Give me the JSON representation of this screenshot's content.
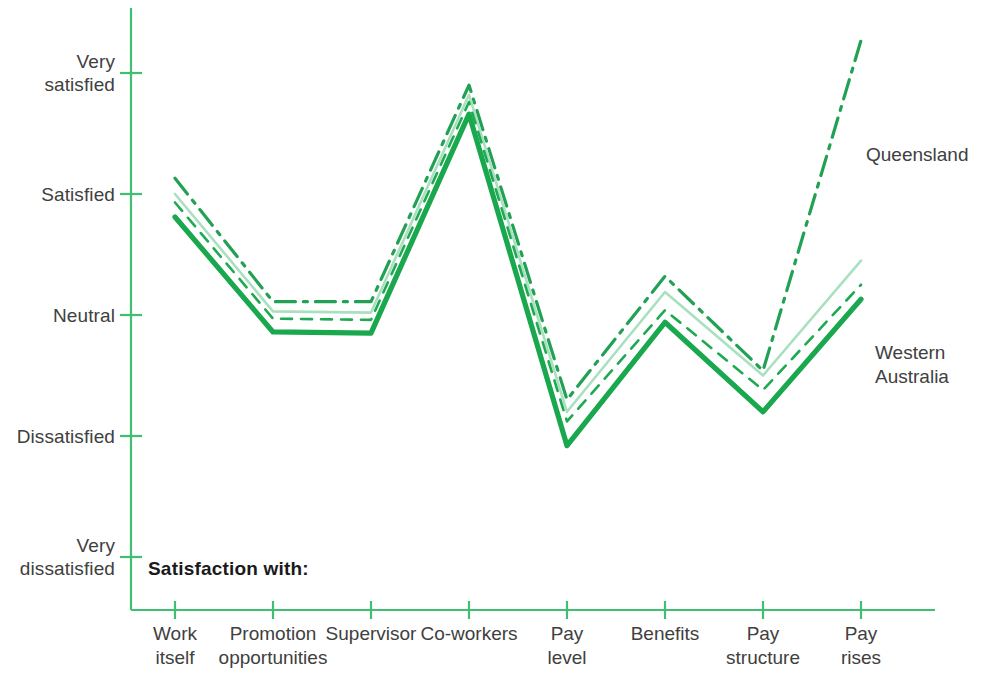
{
  "chart_data": {
    "type": "line",
    "title": "",
    "xlabel": "",
    "ylabel": "",
    "legend_title": "Satisfaction with:",
    "legend_position": "inline-right",
    "grid": false,
    "categories": [
      "Work\nitself",
      "Promotion\nopportunities",
      "Supervisor",
      "Co-workers",
      "Pay\nlevel",
      "Benefits",
      "Pay\nstructure",
      "Pay\nrises"
    ],
    "ytick_labels": [
      "Very\nsatisfied",
      "Satisfied",
      "Neutral",
      "Dissatisfied",
      "Very\ndissatisfied"
    ],
    "ytick_values": [
      5,
      4,
      3,
      2,
      1
    ],
    "ylim": [
      1,
      5
    ],
    "series": [
      {
        "name": "Queensland",
        "style": "dash-dot",
        "color": "#22a154",
        "width": 3.2,
        "labelled": true,
        "values": [
          4.13,
          3.11,
          3.11,
          4.9,
          2.3,
          3.32,
          2.54,
          5.27
        ]
      },
      {
        "name": "Series 2",
        "style": "solid-light",
        "color": "#a9e0bf",
        "width": 2.6,
        "labelled": false,
        "values": [
          4.0,
          3.03,
          3.02,
          4.82,
          2.2,
          3.19,
          2.5,
          3.45
        ]
      },
      {
        "name": "Series 3",
        "style": "dashed",
        "color": "#1faa52",
        "width": 2.6,
        "labelled": false,
        "values": [
          3.93,
          2.97,
          2.96,
          4.76,
          2.12,
          3.04,
          2.38,
          3.25
        ]
      },
      {
        "name": "Western\nAustralia",
        "style": "solid-thick",
        "color": "#19a84e",
        "width": 5.2,
        "labelled": true,
        "values": [
          3.81,
          2.86,
          2.85,
          4.66,
          1.92,
          2.94,
          2.2,
          3.13
        ]
      }
    ],
    "annotations": [
      {
        "text": "Queensland",
        "series": "Queensland"
      },
      {
        "text": "Western\nAustralia",
        "series": "Western\nAustralia"
      }
    ],
    "axis_color": "#3fbf70",
    "text_color": "#404040"
  }
}
